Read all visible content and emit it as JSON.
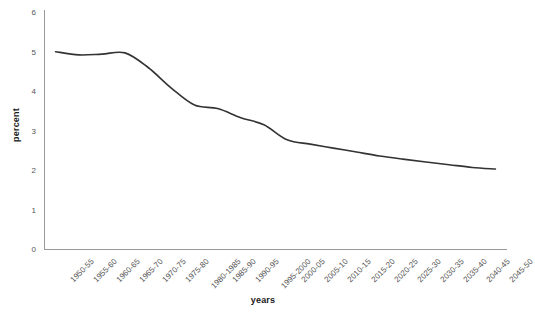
{
  "chart_data": {
    "type": "line",
    "title": "",
    "xlabel": "years",
    "ylabel": "percent",
    "ylim": [
      0,
      6
    ],
    "yticks": [
      "0",
      "1",
      "2",
      "3",
      "4",
      "5",
      "6"
    ],
    "grid": false,
    "legend": "none",
    "line_color": "#333333",
    "axis_color": "#999999",
    "tick_text_color": "#555555",
    "categories": [
      "1950-55",
      "1955-60",
      "1960-65",
      "1965-70",
      "1970-75",
      "1975-80",
      "1980-1985",
      "1985-90",
      "1990-95",
      "1995-2000",
      "2000-05",
      "2005-10",
      "2010-15",
      "2015-20",
      "2020-25",
      "2025-30",
      "2030-35",
      "2035-40",
      "2040-45",
      "2045-50"
    ],
    "values": [
      5.02,
      4.94,
      4.96,
      4.99,
      4.62,
      4.1,
      3.67,
      3.58,
      3.35,
      3.17,
      2.79,
      2.68,
      2.58,
      2.48,
      2.38,
      2.3,
      2.23,
      2.16,
      2.09,
      2.05
    ]
  }
}
